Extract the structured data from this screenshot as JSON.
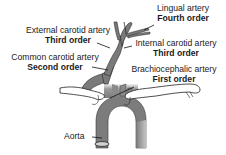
{
  "diagram": {
    "labels": {
      "lingual": {
        "name": "Lingual artery",
        "order": "Fourth order"
      },
      "external_carotid": {
        "name": "External carotid artery",
        "order": "Third order"
      },
      "internal_carotid": {
        "name": "Internal carotid artery",
        "order": "Third order"
      },
      "common_carotid": {
        "name": "Common carotid artery",
        "order": "Second order"
      },
      "brachiocephalic": {
        "name": "Brachiocephalic artery",
        "order": "First order"
      },
      "aorta": {
        "name": "Aorta"
      }
    },
    "colors": {
      "vessel": "#6e6e6e",
      "vessel_light": "#d8d8d8",
      "outline": "#222222",
      "bone": "#ffffff"
    }
  }
}
